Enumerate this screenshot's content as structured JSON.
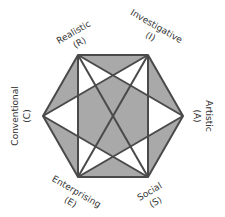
{
  "diagram": {
    "colors": {
      "fill": "#a9a9a9",
      "line": "#4a4a4a",
      "white": "#ffffff",
      "text": "#333333"
    },
    "vertices": [
      {
        "id": "R",
        "name": "Realistic",
        "code": "(R)"
      },
      {
        "id": "I",
        "name": "Investigative",
        "code": "(I)"
      },
      {
        "id": "A",
        "name": "Artistic",
        "code": "(A)"
      },
      {
        "id": "S",
        "name": "Social",
        "code": "(S)"
      },
      {
        "id": "E",
        "name": "Enterprising",
        "code": "(E)"
      },
      {
        "id": "C",
        "name": "Conventional",
        "code": "(C)"
      }
    ]
  }
}
